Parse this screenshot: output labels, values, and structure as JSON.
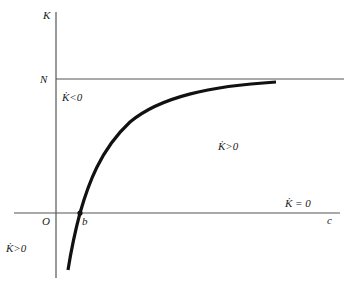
{
  "diagram": {
    "axes": {
      "y_label": "K",
      "x_label": "c",
      "origin_label": "O"
    },
    "asymptote": {
      "label": "N"
    },
    "intercept": {
      "label": "b"
    },
    "regions": {
      "above_curve": "K̇<0",
      "right_of_curve": "K̇>0",
      "below_axis_left": "K̇>0"
    },
    "nullcline_label": "K̇ = 0",
    "colors": {
      "lines": "#444444",
      "curve": "#111111",
      "background": "#ffffff"
    }
  }
}
